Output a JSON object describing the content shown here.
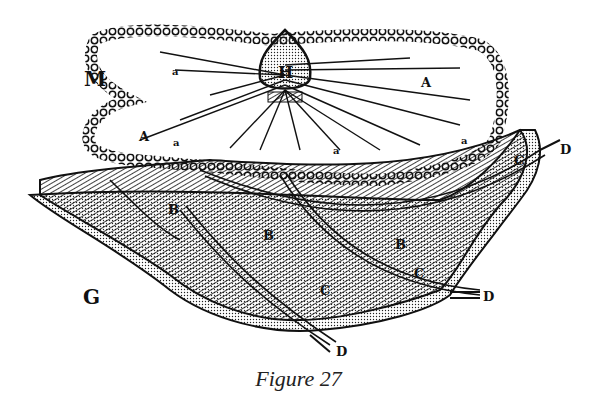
{
  "figure": {
    "caption": "Figure 27",
    "labels": {
      "M": "M",
      "H": "H",
      "A1": "A",
      "A2": "A",
      "a1": "a",
      "a2": "a",
      "a3": "a",
      "a4": "a",
      "B1": "B",
      "B2": "B",
      "B3": "B",
      "C1": "C",
      "C2": "C",
      "C3": "C",
      "D1": "D",
      "D2": "D",
      "D3": "D",
      "G": "G"
    },
    "colors": {
      "ink": "#111111",
      "paper": "#ffffff"
    }
  }
}
